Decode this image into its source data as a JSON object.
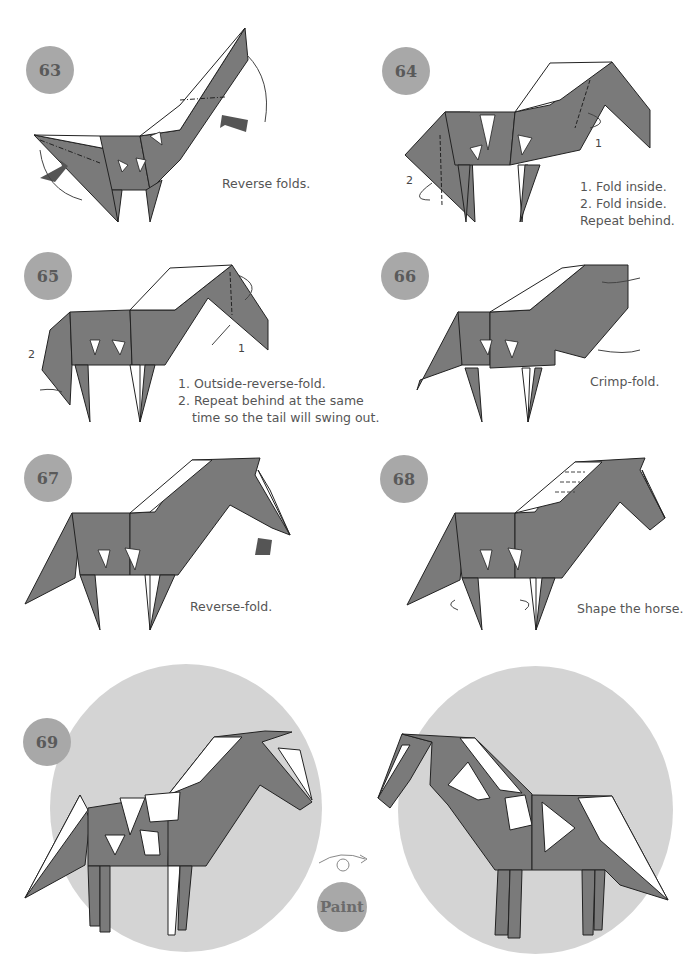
{
  "colors": {
    "paper_dark": "#7a7a7a",
    "paper_light": "#ffffff",
    "badge": "#a8a8a8",
    "badge_text": "#5a5a5a",
    "disc": "#d4d4d4",
    "caption_text": "#555555"
  },
  "steps": [
    {
      "number": "63",
      "caption_lines": [
        "Reverse folds."
      ]
    },
    {
      "number": "64",
      "labels": [
        "1",
        "2"
      ],
      "caption_lines": [
        "1. Fold inside.",
        "2. Fold inside.",
        "Repeat behind."
      ]
    },
    {
      "number": "65",
      "labels": [
        "1",
        "2"
      ],
      "caption_lines": [
        "1. Outside-reverse-fold.",
        "2. Repeat behind at the same",
        "time so the tail will swing out."
      ]
    },
    {
      "number": "66",
      "caption_lines": [
        "Crimp-fold."
      ]
    },
    {
      "number": "67",
      "caption_lines": [
        "Reverse-fold."
      ]
    },
    {
      "number": "68",
      "caption_lines": [
        "Shape the horse."
      ]
    },
    {
      "number": "69",
      "final_badge": "Paint",
      "turn_over_icon": "turn-over-symbol"
    }
  ]
}
